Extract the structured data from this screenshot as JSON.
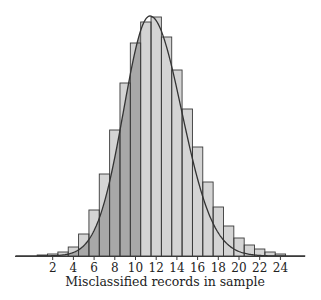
{
  "chart_data": {
    "type": "bar",
    "title": "",
    "xlabel": "Misclassified records in sample",
    "ylabel": "",
    "categories": [
      1,
      2,
      3,
      4,
      5,
      6,
      7,
      8,
      9,
      10,
      11,
      12,
      13,
      14,
      15,
      16,
      17,
      18,
      19,
      20,
      21,
      22,
      23,
      24
    ],
    "values": [
      1,
      2,
      4,
      9,
      22,
      46,
      82,
      126,
      173,
      213,
      234,
      239,
      219,
      186,
      147,
      109,
      74,
      49,
      30,
      18,
      11,
      7,
      4,
      2
    ],
    "value_units": "relative frequency (px height, no y-axis shown)",
    "x_ticks": [
      2,
      4,
      6,
      8,
      10,
      12,
      14,
      16,
      18,
      20,
      22,
      24
    ],
    "xlim": [
      0,
      26
    ],
    "grid": false,
    "legend": null,
    "overlay": "smooth fitted density curve peaking near 11.5",
    "shading": "area under curve shaded darker for x below ~10.5"
  },
  "axis": {
    "xlabel": "Misclassified records in sample",
    "ticks": [
      "2",
      "4",
      "6",
      "8",
      "10",
      "12",
      "14",
      "16",
      "18",
      "20",
      "22",
      "24"
    ]
  },
  "colors": {
    "bar_fill": "#d4d4d4",
    "shaded_fill": "#a8a8a8",
    "stroke": "#3a3a3a",
    "curve": "#333333"
  }
}
